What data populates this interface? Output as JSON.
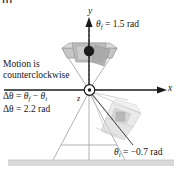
{
  "figure": {
    "tag": "III",
    "background_color": "#ffffff",
    "ink_color": "#1a1a1a"
  },
  "axes": {
    "x_label": "x",
    "y_label": "y",
    "z_label": "z",
    "origin_marker": "z-axis-out-of-page-dot",
    "x_axis_color": "#1a1a1a",
    "y_axis_color": "#1a1a1a"
  },
  "annotations": {
    "theta_final": {
      "symbol": "θ",
      "subscript": "f",
      "equals": "=",
      "value": "1.5 rad",
      "full": "θf = 1.5 rad"
    },
    "theta_initial": {
      "symbol": "θ",
      "subscript": "i",
      "equals": "=",
      "value": "−0.7 rad",
      "full": "θi = −0.7 rad"
    },
    "motion_note": {
      "line1": "Motion is",
      "line2": "counterclockwise"
    },
    "delta_theta": {
      "line1_prefix": "Δθ",
      "line1_equals": "=",
      "line1_term1_symbol": "θ",
      "line1_term1_sub": "f",
      "line1_minus": "−",
      "line1_term2_symbol": "θ",
      "line1_term2_sub": "i",
      "line1_full": "Δθ = θf − θi",
      "line2_prefix": "Δθ",
      "line2_equals": "=",
      "line2_value": "2.2 rad",
      "line2_full": "Δθ = 2.2 rad"
    }
  },
  "objects": {
    "final_body": {
      "name": "rotating-wedge-final",
      "ball_color": "#1c1c1c",
      "body_fill": "#c9c9c9",
      "description": "rotating body at final angle, upper position"
    },
    "initial_body": {
      "name": "rotating-wedge-initial",
      "ball_color": "#8a8a8a",
      "body_fill": "#e3e3e3",
      "description": "ghosted rotating body at initial angle, lower-right position"
    },
    "stand": {
      "name": "support-stand",
      "stroke_color": "#9a9a9a"
    },
    "floor": {
      "name": "ground-surface",
      "fill_color": "#d9d9d9"
    }
  }
}
